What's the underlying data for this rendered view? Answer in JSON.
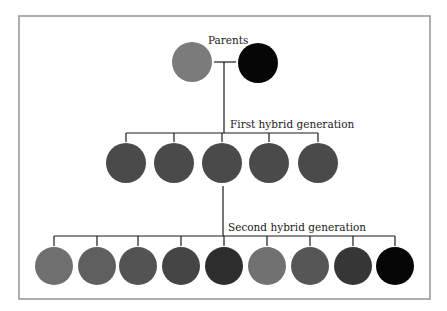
{
  "labels": {
    "parents": "Parents",
    "first_generation": "First hybrid generation",
    "second_generation": "Second hybrid generation"
  },
  "frame": {
    "x": 19,
    "y": 16,
    "width": 411,
    "height": 283,
    "color": "#9a9a9a"
  },
  "parents": {
    "connector_y": 62,
    "stem_x": 224,
    "items": [
      {
        "name": "parent-light",
        "cx": 192,
        "cy": 62,
        "r": 20,
        "color": "#7b7b7b"
      },
      {
        "name": "parent-dark",
        "cx": 258,
        "cy": 63,
        "r": 20,
        "color": "#060606"
      }
    ]
  },
  "first_generation": {
    "bar_y": 133,
    "circle_cy": 163,
    "r": 20,
    "items": [
      {
        "cx": 126,
        "color": "#4a4a4a"
      },
      {
        "cx": 174,
        "color": "#4a4a4a"
      },
      {
        "cx": 222,
        "color": "#4a4a4a"
      },
      {
        "cx": 269,
        "color": "#4a4a4a"
      },
      {
        "cx": 318,
        "color": "#4a4a4a"
      }
    ]
  },
  "second_generation": {
    "bar_y": 236,
    "circle_cy": 266,
    "r": 19,
    "items": [
      {
        "cx": 54,
        "color": "#6f6f6f"
      },
      {
        "cx": 97,
        "color": "#5f5f5f"
      },
      {
        "cx": 138,
        "color": "#535353"
      },
      {
        "cx": 181,
        "color": "#454545"
      },
      {
        "cx": 224,
        "color": "#2e2e2e"
      },
      {
        "cx": 267,
        "color": "#717171"
      },
      {
        "cx": 310,
        "color": "#565656"
      },
      {
        "cx": 353,
        "color": "#363636"
      },
      {
        "cx": 395,
        "color": "#050505"
      }
    ]
  }
}
